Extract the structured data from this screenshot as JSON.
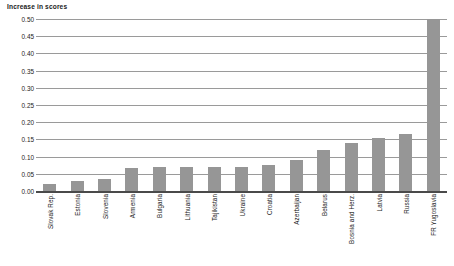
{
  "chart_data": {
    "type": "bar",
    "title": "Increase in scores",
    "xlabel": "",
    "ylabel": "",
    "ylim": [
      0.0,
      0.5
    ],
    "grid": true,
    "legend": "none",
    "orientation": "vertical",
    "bar_color": "#969696",
    "categories": [
      "Slovak Rep.",
      "Estonia",
      "Slovenia",
      "Armenia",
      "Bulgaria",
      "Lithuania",
      "Tajikistan",
      "Ukraine",
      "Croatia",
      "Azerbaijan",
      "Belarus",
      "Bosnia and Herz.",
      "Latvia",
      "Russia",
      "FR Yugoslavia"
    ],
    "values": [
      0.02,
      0.028,
      0.035,
      0.068,
      0.069,
      0.07,
      0.07,
      0.071,
      0.075,
      0.09,
      0.12,
      0.14,
      0.155,
      0.165,
      0.5
    ],
    "ytick_labels": [
      "0.50",
      "0.45",
      "0.40",
      "0.35",
      "0.30",
      "0.25",
      "0.20",
      "0.15",
      "0.10",
      "0.05",
      "0.00"
    ],
    "ytick_values": [
      0.5,
      0.45,
      0.4,
      0.35,
      0.3,
      0.25,
      0.2,
      0.15,
      0.1,
      0.05,
      0.0
    ]
  }
}
